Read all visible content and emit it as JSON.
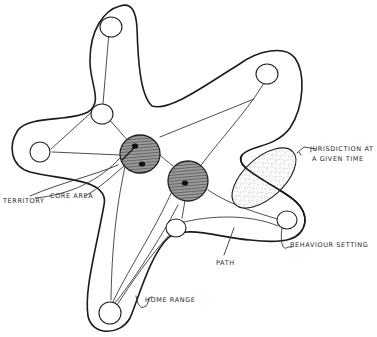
{
  "diagram": {
    "type": "hand-drawn territorial diagram",
    "labels": {
      "territory": "Territory",
      "core_area": "Core area",
      "jurisdiction_line1": "Jurisdiction at",
      "jurisdiction_line2": "a given time",
      "behaviour_setting": "Behaviour setting",
      "path": "Path",
      "home_range": "Home range"
    },
    "colors": {
      "stroke": "#1c1c1c",
      "core_fill": "#8a8a8a",
      "jurisdiction_dots": "#555555",
      "background": "#ffffff"
    },
    "elements": {
      "home_range_outline": "star-shaped closed outline with five arms",
      "behaviour_settings_count": 7,
      "core_areas_count": 2,
      "jurisdiction_area": "stippled ellipse on right"
    }
  }
}
